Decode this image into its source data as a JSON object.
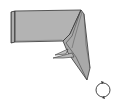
{
  "diagram": {
    "type": "origami-fold-step",
    "paper_color": "#b3b3b3",
    "edge_color": "#3a3a3a",
    "background": "#ffffff",
    "symbols": [
      {
        "name": "turn-over-symbol",
        "meaning": "turn model over",
        "position": [
          103,
          91
        ]
      }
    ]
  }
}
